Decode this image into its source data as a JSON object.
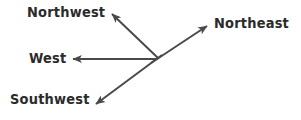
{
  "diagram": {
    "type": "compass-direction-arrows",
    "background_color": "#ffffff",
    "stroke_color": "#4a4a4a",
    "text_color": "#2b2b2b",
    "stroke_width": 2,
    "origin": {
      "x": 158,
      "y": 58
    },
    "labels": {
      "northwest": "Northwest",
      "northeast": "Northeast",
      "west": "West",
      "southwest": "Southwest"
    },
    "arrows": [
      {
        "name": "northwest-arrow",
        "label": "Northwest",
        "tip": {
          "x": 110,
          "y": 12
        }
      },
      {
        "name": "northeast-arrow",
        "label": "Northeast",
        "tip": {
          "x": 209,
          "y": 24
        }
      },
      {
        "name": "west-arrow",
        "label": "West",
        "tip": {
          "x": 70,
          "y": 59
        }
      },
      {
        "name": "southwest-arrow",
        "label": "Southwest",
        "tip": {
          "x": 93,
          "y": 107
        }
      }
    ]
  }
}
